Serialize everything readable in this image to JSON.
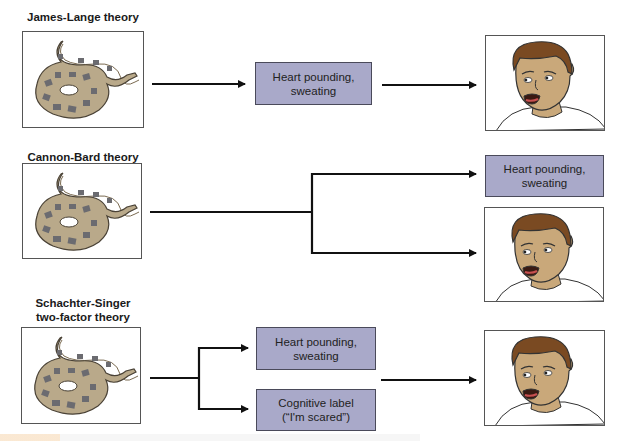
{
  "theories": [
    {
      "title": "James-Lange theory",
      "stimulus": "snake-illustration",
      "boxes": [
        {
          "line1": "Heart pounding,",
          "line2": "sweating"
        }
      ],
      "outcome": "frightened-face-illustration"
    },
    {
      "title": "Cannon-Bard theory",
      "stimulus": "snake-illustration",
      "boxes": [
        {
          "line1": "Heart pounding,",
          "line2": "sweating"
        }
      ],
      "outcome": "frightened-face-illustration"
    },
    {
      "title_line1": "Schachter-Singer",
      "title_line2": "two-factor theory",
      "stimulus": "snake-illustration",
      "boxes": [
        {
          "line1": "Heart pounding,",
          "line2": "sweating"
        },
        {
          "line1": "Cognitive label",
          "line2": "(“I'm scared”)"
        }
      ],
      "outcome": "frightened-face-illustration"
    }
  ],
  "colors": {
    "box_fill": "#a9a9c9",
    "box_border": "#4a4a5a",
    "arrow": "#111111",
    "snake_body": "#b9a98a",
    "snake_patch": "#6b6b70",
    "skin": "#c9a87a",
    "hair": "#7a4a22"
  }
}
